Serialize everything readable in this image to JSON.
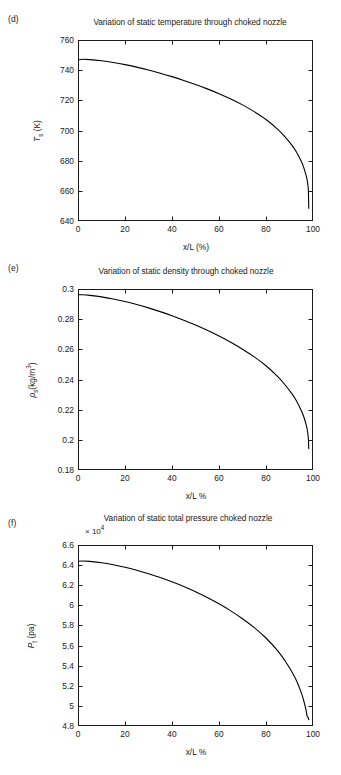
{
  "figure": {
    "panels": [
      {
        "letter": "(d)",
        "title": "Variation of static temperature through choked nozzle",
        "multiplier": "",
        "ylabel_html": "<i>T</i><sub>s</sub> (K)",
        "xlabel": "x/L (%)",
        "yticks": [
          "640",
          "660",
          "680",
          "700",
          "720",
          "740",
          "760"
        ],
        "xticks": [
          "0",
          "20",
          "40",
          "60",
          "80",
          "100"
        ]
      },
      {
        "letter": "(e)",
        "title": "Variation of static density through choked nozzle",
        "multiplier": "",
        "ylabel_html": "<i>&rho;</i><sub>s</sub>(kg/m<sup>3</sup>)",
        "xlabel": "x/L %",
        "yticks": [
          "0.18",
          "0.2",
          "0.22",
          "0.24",
          "0.26",
          "0.28",
          "0.3"
        ],
        "xticks": [
          "0",
          "20",
          "40",
          "60",
          "80",
          "100"
        ]
      },
      {
        "letter": "(f)",
        "title": "Variation of static total pressure choked nozzle",
        "multiplier": "× 10",
        "multiplier_exp": "4",
        "ylabel_html": "<i>P</i><sub>t</sub> (pa)",
        "xlabel": "x/L %",
        "yticks": [
          "4.8",
          "5",
          "5.2",
          "5.4",
          "5.6",
          "5.8",
          "6",
          "6.2",
          "6.4",
          "6.6"
        ],
        "xticks": [
          "0",
          "20",
          "40",
          "60",
          "80",
          "100"
        ]
      }
    ]
  },
  "chart_data": [
    {
      "type": "line",
      "panel": "d",
      "title": "Variation of static temperature through choked nozzle",
      "xlabel": "x/L (%)",
      "ylabel": "T_s (K)",
      "xlim": [
        0,
        100
      ],
      "ylim": [
        640,
        760
      ],
      "xticks": [
        0,
        20,
        40,
        60,
        80,
        100
      ],
      "yticks": [
        640,
        660,
        680,
        700,
        720,
        740,
        760
      ],
      "grid": false,
      "legend": "none",
      "series": [
        {
          "name": "static temperature",
          "color": "#000000",
          "x": [
            0,
            2,
            5,
            10,
            15,
            20,
            25,
            30,
            35,
            40,
            45,
            50,
            55,
            60,
            65,
            70,
            75,
            80,
            85,
            88,
            91,
            93,
            95,
            96,
            97,
            97.5,
            98,
            98.2
          ],
          "y": [
            746.8,
            747.2,
            747.0,
            746.2,
            745.1,
            743.7,
            742.0,
            740.1,
            738.0,
            735.7,
            733.2,
            730.5,
            727.6,
            724.4,
            720.9,
            717.0,
            712.5,
            707.3,
            700.8,
            696.0,
            690.3,
            685.6,
            679.6,
            675.7,
            670.6,
            667.2,
            661.0,
            648.5
          ]
        }
      ]
    },
    {
      "type": "line",
      "panel": "e",
      "title": "Variation of static density through choked nozzle",
      "xlabel": "x/L %",
      "ylabel": "rho_s (kg/m^3)",
      "xlim": [
        0,
        100
      ],
      "ylim": [
        0.18,
        0.3
      ],
      "xticks": [
        0,
        20,
        40,
        60,
        80,
        100
      ],
      "yticks": [
        0.18,
        0.2,
        0.22,
        0.24,
        0.26,
        0.28,
        0.3
      ],
      "grid": false,
      "legend": "none",
      "series": [
        {
          "name": "static density",
          "color": "#000000",
          "x": [
            0,
            2,
            5,
            10,
            15,
            20,
            25,
            30,
            35,
            40,
            45,
            50,
            55,
            60,
            65,
            70,
            75,
            80,
            85,
            88,
            91,
            93,
            95,
            96,
            97,
            97.5,
            98,
            98.2
          ],
          "y": [
            0.2962,
            0.2962,
            0.2958,
            0.2948,
            0.2934,
            0.2917,
            0.2897,
            0.2875,
            0.285,
            0.2823,
            0.2793,
            0.2761,
            0.2726,
            0.2688,
            0.2647,
            0.2601,
            0.255,
            0.2491,
            0.2419,
            0.2367,
            0.2306,
            0.2257,
            0.2195,
            0.2156,
            0.2106,
            0.2072,
            0.2014,
            0.1942
          ]
        }
      ]
    },
    {
      "type": "line",
      "panel": "f",
      "title": "Variation of static total pressure choked nozzle",
      "xlabel": "x/L %",
      "ylabel": "P_t (pa)",
      "y_multiplier": 10000,
      "xlim": [
        0,
        100
      ],
      "ylim": [
        4.8,
        6.6
      ],
      "xticks": [
        0,
        20,
        40,
        60,
        80,
        100
      ],
      "yticks": [
        4.8,
        5,
        5.2,
        5.4,
        5.6,
        5.8,
        6,
        6.2,
        6.4,
        6.6
      ],
      "grid": false,
      "legend": "none",
      "series": [
        {
          "name": "static total pressure",
          "color": "#000000",
          "x": [
            0,
            2,
            5,
            10,
            15,
            20,
            25,
            30,
            35,
            40,
            45,
            50,
            55,
            60,
            65,
            70,
            75,
            80,
            85,
            88,
            91,
            93,
            95,
            96,
            97,
            97.5,
            98,
            98.2
          ],
          "y": [
            6.438,
            6.441,
            6.437,
            6.424,
            6.404,
            6.379,
            6.349,
            6.315,
            6.277,
            6.234,
            6.187,
            6.135,
            6.078,
            6.015,
            5.945,
            5.867,
            5.779,
            5.675,
            5.547,
            5.452,
            5.34,
            5.249,
            5.132,
            5.058,
            4.962,
            4.898,
            4.882,
            4.862
          ]
        }
      ]
    }
  ]
}
